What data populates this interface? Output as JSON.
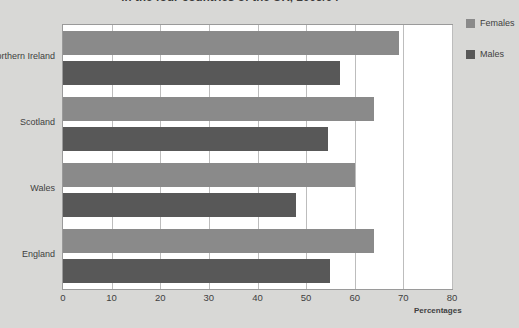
{
  "chart_data": {
    "type": "bar",
    "orientation": "horizontal",
    "title": "in the four countries of the UK, 2003/04",
    "categories": [
      "Northern Ireland",
      "Scotland",
      "Wales",
      "England"
    ],
    "series": [
      {
        "name": "Females",
        "color": "#8a8a8a",
        "values": [
          69,
          64,
          60,
          64
        ]
      },
      {
        "name": "Males",
        "color": "#585858",
        "values": [
          57,
          54.5,
          48,
          55
        ]
      }
    ],
    "xlabel": "Percentages",
    "ylabel": "",
    "xlim": [
      0,
      80
    ],
    "xticks": [
      0,
      10,
      20,
      30,
      40,
      50,
      60,
      70,
      80
    ],
    "xtick_labels": [
      "0",
      "10",
      "20",
      "30",
      "40",
      "50",
      "60",
      "70",
      "80"
    ],
    "grid": true,
    "legend_position": "right"
  },
  "legend": {
    "items": [
      {
        "label": "Females",
        "swatch": "#8a8a8a"
      },
      {
        "label": "Males",
        "swatch": "#585858"
      }
    ]
  },
  "colors": {
    "background": "#d8d8d6",
    "plot_background": "#ffffff",
    "gridline": "#bdbdbd",
    "frame": "#9a9a9a",
    "text": "#3f3f3f"
  }
}
